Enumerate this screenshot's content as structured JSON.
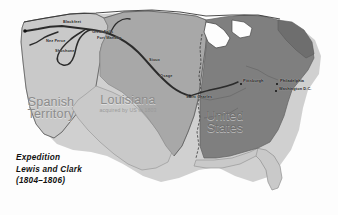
{
  "map": {
    "title": "Lewis and Clark Expedition map of the United States, 1804-1806",
    "background_color": "#fdfdfd",
    "regions": [
      {
        "id": "spanish-territory",
        "name": "Spanish",
        "name_line2": "Territory",
        "subtitle": "",
        "fill": "#c9c9c9",
        "label_x": 45,
        "label_y": 96
      },
      {
        "id": "louisiana",
        "name": "Louisiana",
        "name_line2": "",
        "subtitle": "acquired by US in 1803",
        "fill": "#a8a8a8",
        "label_x": 112,
        "label_y": 95
      },
      {
        "id": "united-states",
        "name": "United",
        "name_line2": "States",
        "subtitle": "",
        "fill": "#7f7f7f",
        "label_x": 215,
        "label_y": 112
      }
    ],
    "route": {
      "id": "expedition-route",
      "color": "#2b2b2b",
      "label": "Lewis and Clark expedition route"
    },
    "annotations": [
      {
        "id": "blackfeet",
        "text": "Blackfeet",
        "x": 63,
        "y": 20,
        "dot": false
      },
      {
        "id": "great-falls",
        "text": "Great Falls",
        "x": 92,
        "y": 30,
        "dot": false
      },
      {
        "id": "fort-mandan",
        "text": "Fort Mandan",
        "x": 97,
        "y": 36,
        "dot": false
      },
      {
        "id": "nez-perce",
        "text": "Nez Perce",
        "x": 46,
        "y": 39,
        "dot": false
      },
      {
        "id": "shoshone",
        "text": "Shoshone",
        "x": 55,
        "y": 49,
        "dot": false
      },
      {
        "id": "sioux",
        "text": "Sioux",
        "x": 149,
        "y": 58,
        "dot": false
      },
      {
        "id": "osage",
        "text": "Osage",
        "x": 160,
        "y": 74,
        "dot": false
      },
      {
        "id": "saint-charles",
        "text": "Saint Charles",
        "x": 186,
        "y": 95,
        "dot": false
      },
      {
        "id": "pittsburgh",
        "text": "Pittsburgh",
        "x": 243,
        "y": 79,
        "dot": true
      },
      {
        "id": "philadelphia",
        "text": "Philadelphia",
        "x": 280,
        "y": 79,
        "dot": true
      },
      {
        "id": "washington-dc",
        "text": "Washington D.C.",
        "x": 279,
        "y": 87,
        "dot": true
      }
    ],
    "legend": {
      "line1": "Expedition",
      "line2": "Lewis and Clark",
      "line3": "(1804–1806)"
    }
  }
}
